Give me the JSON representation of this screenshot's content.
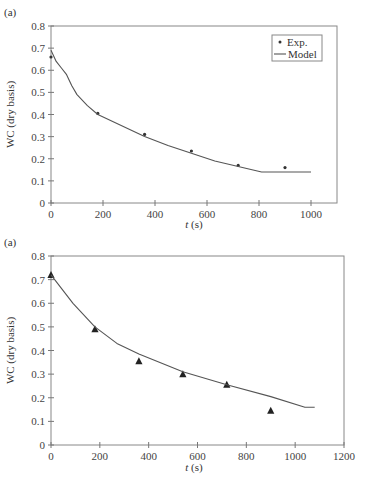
{
  "chart_data": [
    {
      "type": "line",
      "panel_label": "(a)",
      "title": "",
      "xlabel": "t (s)",
      "ylabel": "WC (dry basis)",
      "xlim": [
        0,
        1100
      ],
      "ylim": [
        0,
        0.8
      ],
      "xticks": [
        0,
        200,
        400,
        600,
        800,
        1000
      ],
      "yticks": [
        0,
        0.1,
        0.2,
        0.3,
        0.4,
        0.5,
        0.6,
        0.7,
        0.8
      ],
      "grid": false,
      "legend": {
        "position": "upper right",
        "entries": [
          "Exp.",
          "Model"
        ]
      },
      "series": [
        {
          "name": "Exp.",
          "style": "dot",
          "x": [
            0,
            180,
            360,
            540,
            720,
            900
          ],
          "y": [
            0.66,
            0.405,
            0.31,
            0.235,
            0.17,
            0.16
          ]
        },
        {
          "name": "Model",
          "style": "line",
          "x": [
            0,
            20,
            40,
            60,
            80,
            100,
            140,
            180,
            270,
            360,
            450,
            540,
            630,
            720,
            810,
            1000
          ],
          "y": [
            0.69,
            0.64,
            0.61,
            0.58,
            0.53,
            0.49,
            0.44,
            0.4,
            0.35,
            0.3,
            0.26,
            0.225,
            0.19,
            0.165,
            0.14,
            0.14
          ]
        }
      ]
    },
    {
      "type": "line",
      "panel_label": "(a)",
      "title": "",
      "xlabel": "t (s)",
      "ylabel": "WC (dry basis)",
      "xlim": [
        0,
        1200
      ],
      "ylim": [
        0,
        0.8
      ],
      "xticks": [
        0,
        200,
        400,
        600,
        800,
        1000,
        1200
      ],
      "yticks": [
        0,
        0.1,
        0.2,
        0.3,
        0.4,
        0.5,
        0.6,
        0.7,
        0.8
      ],
      "grid": false,
      "legend": null,
      "series": [
        {
          "name": "Exp.",
          "style": "triangle",
          "x": [
            0,
            180,
            360,
            540,
            720,
            900
          ],
          "y": [
            0.72,
            0.49,
            0.355,
            0.3,
            0.255,
            0.145
          ]
        },
        {
          "name": "Model",
          "style": "line",
          "x": [
            0,
            90,
            180,
            270,
            360,
            540,
            720,
            900,
            1040,
            1080
          ],
          "y": [
            0.72,
            0.6,
            0.5,
            0.43,
            0.385,
            0.31,
            0.255,
            0.205,
            0.16,
            0.16
          ]
        }
      ]
    }
  ]
}
